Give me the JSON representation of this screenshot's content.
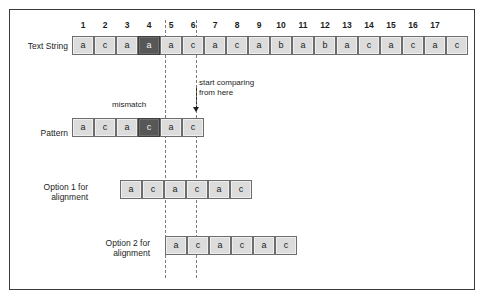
{
  "diagram": {
    "colors": {
      "cell_fill": "#dcdcdc",
      "cell_highlight": "#575757",
      "cell_border": "#6d6d6d",
      "guide": "#7a7a7a",
      "frame": "#3a3a3c",
      "text": "#1d1d1d"
    },
    "indices": [
      "1",
      "2",
      "3",
      "4",
      "5",
      "6",
      "7",
      "8",
      "9",
      "10",
      "11",
      "12",
      "13",
      "14",
      "15",
      "16",
      "17"
    ],
    "rows": [
      {
        "id": "text-string",
        "label": "Text String",
        "label_align": "right",
        "cells": [
          "a",
          "c",
          "a",
          "a",
          "a",
          "c",
          "a",
          "c",
          "a",
          "b",
          "a",
          "b",
          "a",
          "c",
          "a",
          "c",
          "a",
          "c"
        ],
        "highlight_index": 3
      },
      {
        "id": "pattern",
        "label": "Pattern",
        "label_align": "right",
        "cells": [
          "a",
          "c",
          "a",
          "c",
          "a",
          "c"
        ],
        "highlight_index": 3
      },
      {
        "id": "option-1",
        "label": "Option 1 for\nalignment",
        "label_align": "right",
        "cells": [
          "a",
          "c",
          "a",
          "c",
          "a",
          "c"
        ],
        "highlight_index": -1
      },
      {
        "id": "option-2",
        "label": "Option 2 for\nalignment",
        "label_align": "right",
        "cells": [
          "a",
          "c",
          "a",
          "c",
          "a",
          "c"
        ],
        "highlight_index": -1
      }
    ],
    "annotations": {
      "mismatch": "mismatch",
      "start_comparing": "start comparing\nfrom here"
    }
  }
}
